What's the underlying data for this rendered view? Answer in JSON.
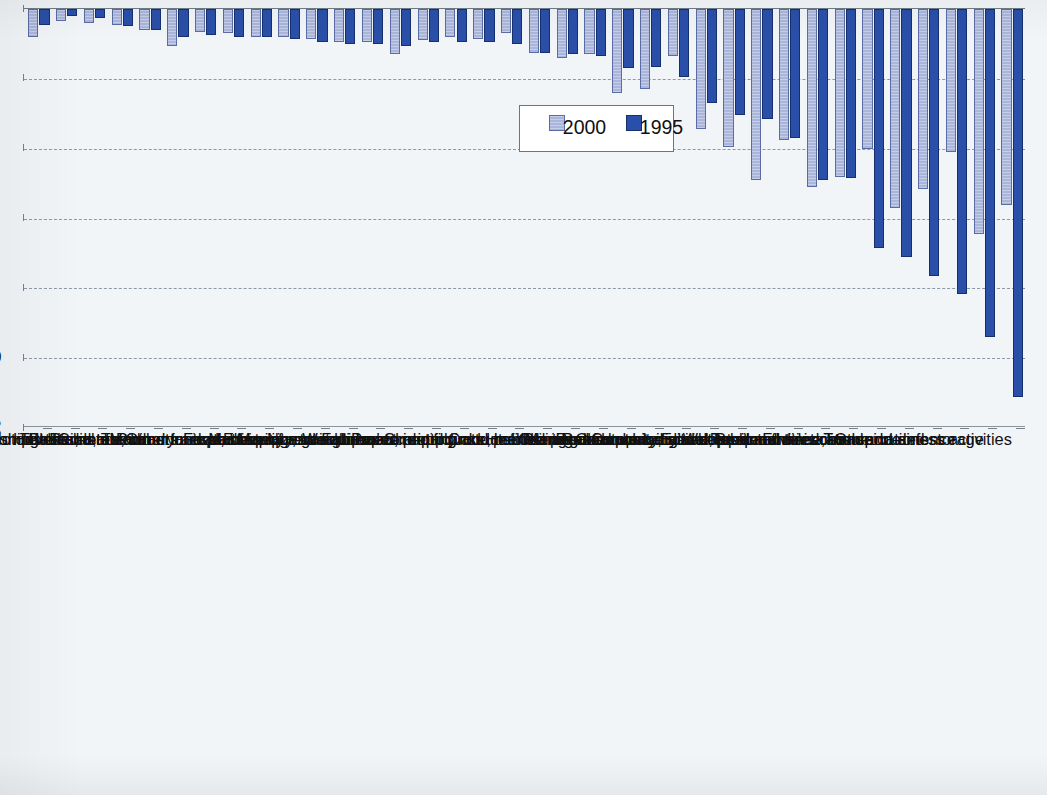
{
  "chart_data": {
    "type": "bar",
    "title": "",
    "xlabel": "",
    "ylabel": "%",
    "ylim": [
      0,
      12
    ],
    "yticks": [
      0,
      2,
      4,
      6,
      8,
      10,
      12
    ],
    "ytick_labels": [
      "0",
      "2",
      "4",
      "6",
      "8",
      "10",
      "12"
    ],
    "grid": true,
    "orientation": "rotated-90",
    "legend_position": "inside-upper-area",
    "categories": [
      "Other business activities",
      "Transport and storage",
      "Public administration and defence",
      "Post and telecommunications",
      "Finance, insurance",
      "Wholesale and retail trade",
      "Community, social, personal services",
      "Computer and related activities",
      "Renting of machinery and equipment",
      "Research and development",
      "Education",
      "Real estate activities",
      "Mining and quarrying",
      "Health and social work",
      "Coke, refined petroleum",
      "Chemicals",
      "Paper, printing and publishing",
      "Scientific instruments",
      "Fabricated metal products",
      "Non-metallic mineral products",
      "Electricity, gas and water supply",
      "Machinery and equipment nec",
      "Food, beverages and tobacco",
      "Manufacturing nec",
      "Wood",
      "Other transport equipment",
      "Radio, TV, communication equip.",
      "Rubber and plastics",
      "Textiles, leather and footwear",
      "Electrical machinery nec",
      "Hotels and restaurants",
      "Construction",
      "Basic metals",
      "Motor vehicles",
      "Office machinery and computers",
      "Agriculture, forestry and fishing"
    ],
    "series": [
      {
        "name": "1995",
        "color": "#2a4fa8",
        "values": [
          11.1,
          9.4,
          8.15,
          7.65,
          7.1,
          6.85,
          4.85,
          4.9,
          3.7,
          3.15,
          3.05,
          2.7,
          1.95,
          1.65,
          1.7,
          1.35,
          1.3,
          1.25,
          1.0,
          0.95,
          0.95,
          0.95,
          1.05,
          1.0,
          1.0,
          0.95,
          0.85,
          0.8,
          0.8,
          0.75,
          0.8,
          0.6,
          0.5,
          0.25,
          0.2,
          0.45
        ]
      },
      {
        "name": "2000",
        "color": "#a9b5da",
        "values": [
          5.6,
          6.45,
          4.1,
          5.15,
          5.7,
          4.0,
          4.8,
          5.1,
          3.75,
          4.9,
          3.95,
          3.45,
          1.35,
          2.3,
          2.4,
          1.3,
          1.4,
          1.25,
          0.7,
          0.85,
          0.8,
          0.9,
          1.3,
          0.95,
          0.95,
          0.85,
          0.8,
          0.8,
          0.7,
          0.65,
          1.05,
          0.6,
          0.45,
          0.4,
          0.35,
          0.8
        ]
      }
    ],
    "legend": [
      {
        "label": "1995",
        "swatch": "dark-blue-swatch"
      },
      {
        "label": "2000",
        "swatch": "light-blue-swatch"
      }
    ]
  }
}
